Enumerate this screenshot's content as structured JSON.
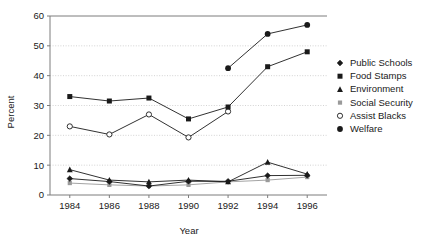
{
  "chart_data": {
    "type": "line",
    "title": "",
    "xlabel": "Year",
    "ylabel": "Percent",
    "categories": [
      1984,
      1986,
      1988,
      1990,
      1992,
      1994,
      1996
    ],
    "x_tick_labels": [
      "1984",
      "1986",
      "1988",
      "1990",
      "1992",
      "1994",
      "1996"
    ],
    "y_tick_labels": [
      "0",
      "10",
      "20",
      "30",
      "40",
      "50",
      "60"
    ],
    "y_ticks": [
      0,
      10,
      20,
      30,
      40,
      50,
      60
    ],
    "xlim": [
      1983,
      1997
    ],
    "ylim": [
      0,
      60
    ],
    "grid": "horizontal-dotted",
    "legend_position": "right",
    "series": [
      {
        "name": "Public Schools",
        "marker": "diamond",
        "color": "#1a1a1a",
        "x": [
          1984,
          1986,
          1988,
          1990,
          1992,
          1994,
          1996
        ],
        "values": [
          5.5,
          4.5,
          3.0,
          4.6,
          4.6,
          6.5,
          6.6
        ]
      },
      {
        "name": "Food Stamps",
        "marker": "square",
        "color": "#1a1a1a",
        "x": [
          1984,
          1986,
          1988,
          1990,
          1992,
          1994,
          1996
        ],
        "values": [
          33.0,
          31.5,
          32.5,
          25.5,
          29.5,
          43.0,
          48.0
        ]
      },
      {
        "name": "Environment",
        "marker": "triangle",
        "color": "#1a1a1a",
        "x": [
          1984,
          1986,
          1988,
          1990,
          1992,
          1994,
          1996
        ],
        "values": [
          8.5,
          5.0,
          4.4,
          5.0,
          4.4,
          11.0,
          7.0
        ]
      },
      {
        "name": "Social Security",
        "marker": "small-square-gray",
        "color": "#9a9a9a",
        "x": [
          1984,
          1986,
          1988,
          1990,
          1992,
          1994,
          1996
        ],
        "values": [
          4.0,
          3.4,
          3.0,
          3.4,
          4.4,
          5.0,
          6.0
        ]
      },
      {
        "name": "Assist Blacks",
        "marker": "open-circle",
        "color": "#1a1a1a",
        "x": [
          1984,
          1986,
          1988,
          1990,
          1992
        ],
        "values": [
          23.0,
          20.3,
          27.0,
          19.3,
          28.0
        ]
      },
      {
        "name": "Welfare",
        "marker": "filled-circle",
        "color": "#1a1a1a",
        "x": [
          1992,
          1994,
          1996
        ],
        "values": [
          42.5,
          54.0,
          57.0
        ]
      }
    ]
  },
  "legend": {
    "items": [
      {
        "label": "Public Schools",
        "marker": "diamond"
      },
      {
        "label": "Food Stamps",
        "marker": "square"
      },
      {
        "label": "Environment",
        "marker": "triangle"
      },
      {
        "label": "Social Security",
        "marker": "small-square-gray"
      },
      {
        "label": "Assist Blacks",
        "marker": "open-circle"
      },
      {
        "label": "Welfare",
        "marker": "filled-circle"
      }
    ]
  },
  "axes": {
    "y_title": "Percent",
    "x_title": "Year"
  }
}
